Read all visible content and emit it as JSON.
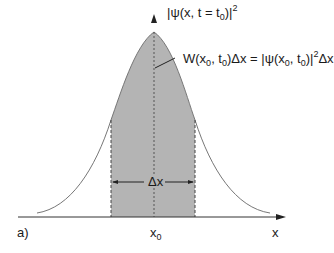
{
  "figure": {
    "panel_label": "a)",
    "y_axis_label": {
      "prefix": "|ψ(x, t = t",
      "sub": "0",
      "suffix": ")|",
      "sup": "2"
    },
    "x_axis_label": "x",
    "center_label": {
      "main": "x",
      "sub": "0"
    },
    "delta_label": "Δx",
    "annotation": {
      "part1": "W(x",
      "sub1": "0",
      "part2": ", t",
      "sub2": "0",
      "part3": ")Δx = |ψ(x",
      "sub3": "0",
      "part4": ", t",
      "sub4": "0",
      "part5": ")|",
      "sup": "2",
      "part6": "Δx"
    },
    "colors": {
      "fill": "#b4b4b4",
      "line": "#333333",
      "curve": "#777777"
    }
  }
}
